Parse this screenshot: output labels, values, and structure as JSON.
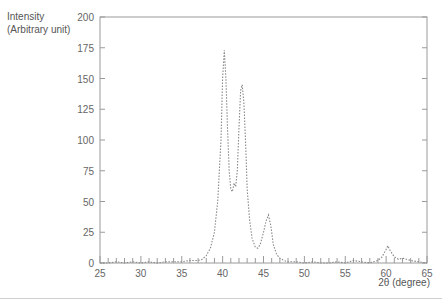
{
  "chart_data": {
    "type": "line",
    "title": "",
    "ylabel": [
      "Intensity",
      "(Arbitrary unit)"
    ],
    "xlabel": "2θ (degree)",
    "xlim": [
      25,
      65
    ],
    "ylim": [
      0,
      200
    ],
    "xticks": [
      25,
      30,
      35,
      40,
      45,
      50,
      55,
      60,
      65
    ],
    "yticks": [
      0,
      25,
      50,
      75,
      100,
      125,
      150,
      175,
      200
    ],
    "grid": false,
    "legend": null,
    "line_style": "dotted",
    "line_color": "#888888",
    "x": [
      25,
      26,
      27,
      28,
      29,
      30,
      31,
      32,
      33,
      34,
      35,
      36,
      37,
      37.5,
      38,
      38.5,
      39,
      39.4,
      39.8,
      40.0,
      40.2,
      40.4,
      40.6,
      40.8,
      41.0,
      41.2,
      41.4,
      41.6,
      41.8,
      42.0,
      42.2,
      42.4,
      42.6,
      42.8,
      43.0,
      43.3,
      43.6,
      44.0,
      44.3,
      44.6,
      45.0,
      45.3,
      45.6,
      45.9,
      46.2,
      46.6,
      47.0,
      47.5,
      48,
      49,
      50,
      51,
      52,
      53,
      54,
      55,
      56,
      57,
      58,
      59,
      59.5,
      60.0,
      60.2,
      60.5,
      61,
      61.5,
      62,
      63,
      64,
      65
    ],
    "y": [
      0,
      0,
      1,
      0,
      1,
      0,
      1,
      0,
      1,
      1,
      1,
      2,
      2,
      3,
      6,
      12,
      25,
      50,
      100,
      150,
      173,
      150,
      110,
      75,
      60,
      58,
      65,
      62,
      75,
      110,
      140,
      145,
      130,
      100,
      60,
      35,
      20,
      13,
      12,
      15,
      25,
      34,
      39,
      30,
      15,
      7,
      4,
      2,
      1,
      1,
      0,
      1,
      0,
      0,
      1,
      0,
      2,
      1,
      0,
      2,
      5,
      11,
      14,
      10,
      5,
      3,
      4,
      2,
      1,
      0
    ]
  },
  "axes": {
    "y_label_line1": "Intensity",
    "y_label_line2": "(Arbitrary unit)",
    "x_label": "2θ (degree)",
    "y_tick_labels": [
      "0",
      "25",
      "50",
      "75",
      "100",
      "125",
      "150",
      "175",
      "200"
    ],
    "x_tick_labels": [
      "25",
      "30",
      "35",
      "40",
      "45",
      "50",
      "55",
      "60",
      "65"
    ]
  }
}
